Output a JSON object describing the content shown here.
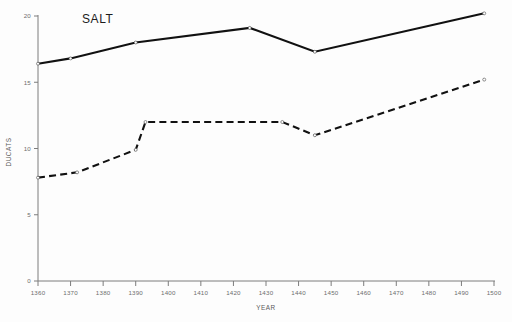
{
  "chart_data": {
    "type": "line",
    "title": "SALT",
    "xlabel": "YEAR",
    "ylabel": "DUCATS",
    "xlim": [
      1360,
      1500
    ],
    "ylim": [
      0,
      20
    ],
    "xticks": [
      1360,
      1370,
      1380,
      1390,
      1400,
      1410,
      1420,
      1430,
      1440,
      1450,
      1460,
      1470,
      1480,
      1490,
      1500
    ],
    "yticks": [
      0,
      5,
      10,
      15,
      20
    ],
    "grid": false,
    "legend": "none",
    "series": [
      {
        "name": "upper-solid",
        "style": "solid",
        "points": [
          [
            1360,
            16.4
          ],
          [
            1370,
            16.8
          ],
          [
            1390,
            18.0
          ],
          [
            1425,
            19.1
          ],
          [
            1445,
            17.3
          ],
          [
            1497,
            20.2
          ]
        ]
      },
      {
        "name": "lower-dashed",
        "style": "dashed",
        "points": [
          [
            1360,
            7.8
          ],
          [
            1372,
            8.2
          ],
          [
            1390,
            9.9
          ],
          [
            1393,
            12.0
          ],
          [
            1435,
            12.0
          ],
          [
            1445,
            11.0
          ],
          [
            1497,
            15.2
          ]
        ]
      }
    ]
  },
  "labels": {
    "title": "SALT",
    "xaxis": "YEAR",
    "yaxis": "DUCATS"
  }
}
